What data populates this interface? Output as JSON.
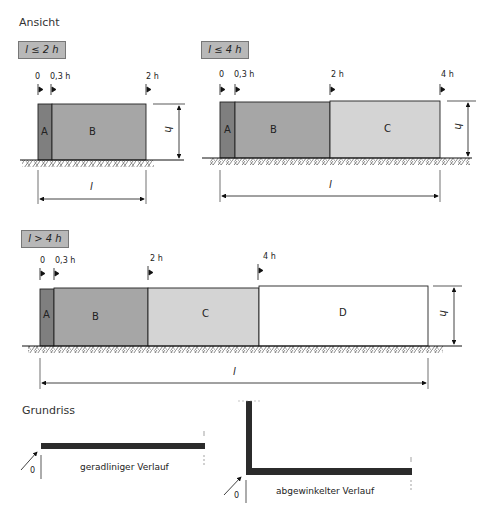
{
  "sections": {
    "ansicht": "Ansicht",
    "grundriss": "Grundriss"
  },
  "colors": {
    "A": "#7f7f7f",
    "B": "#a6a6a6",
    "C": "#d4d4d4",
    "D": "#ffffff",
    "badge": "#b8b8b8",
    "wall_plan": "#2b2b2b"
  },
  "diagrams": [
    {
      "badge": "l ≤ 2 h",
      "ticks": [
        "0",
        "0,3 h",
        "2 h"
      ],
      "segments": [
        "A",
        "B"
      ],
      "height_label": "h",
      "length_label": "l"
    },
    {
      "badge": "l ≤ 4 h",
      "ticks": [
        "0",
        "0,3 h",
        "2 h",
        "4 h"
      ],
      "segments": [
        "A",
        "B",
        "C"
      ],
      "height_label": "h",
      "length_label": "l"
    },
    {
      "badge": "l > 4 h",
      "ticks": [
        "0",
        "0,3 h",
        "2 h",
        "4 h"
      ],
      "segments": [
        "A",
        "B",
        "C",
        "D"
      ],
      "height_label": "h",
      "length_label": "l"
    }
  ],
  "plans": [
    {
      "origin": "0",
      "caption": "geradliniger Verlauf"
    },
    {
      "origin": "0",
      "caption": "abgewinkelter Verlauf"
    }
  ]
}
